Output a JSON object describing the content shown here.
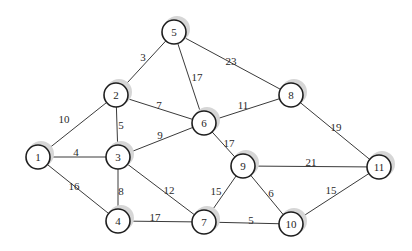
{
  "diagram": {
    "type": "weighted-undirected-graph",
    "node_radius": 12,
    "nodes": [
      {
        "id": "1",
        "x": 38,
        "y": 157
      },
      {
        "id": "2",
        "x": 116,
        "y": 95
      },
      {
        "id": "3",
        "x": 118,
        "y": 157
      },
      {
        "id": "4",
        "x": 118,
        "y": 221
      },
      {
        "id": "5",
        "x": 174,
        "y": 32
      },
      {
        "id": "6",
        "x": 204,
        "y": 123
      },
      {
        "id": "7",
        "x": 204,
        "y": 222
      },
      {
        "id": "8",
        "x": 291,
        "y": 95
      },
      {
        "id": "9",
        "x": 243,
        "y": 166
      },
      {
        "id": "10",
        "x": 291,
        "y": 224
      },
      {
        "id": "11",
        "x": 379,
        "y": 167
      }
    ],
    "edges": [
      {
        "from": "1",
        "to": "2",
        "weight": "10",
        "lx": 64,
        "ly": 120
      },
      {
        "from": "1",
        "to": "3",
        "weight": "4",
        "lx": 76,
        "ly": 153
      },
      {
        "from": "1",
        "to": "4",
        "weight": "16",
        "lx": 74,
        "ly": 187
      },
      {
        "from": "2",
        "to": "5",
        "weight": "3",
        "lx": 143,
        "ly": 58
      },
      {
        "from": "2",
        "to": "3",
        "weight": "5",
        "lx": 121,
        "ly": 126
      },
      {
        "from": "2",
        "to": "6",
        "weight": "7",
        "lx": 159,
        "ly": 106
      },
      {
        "from": "3",
        "to": "6",
        "weight": "9",
        "lx": 160,
        "ly": 136
      },
      {
        "from": "3",
        "to": "4",
        "weight": "8",
        "lx": 121,
        "ly": 192
      },
      {
        "from": "3",
        "to": "7",
        "weight": "12",
        "lx": 169,
        "ly": 191
      },
      {
        "from": "4",
        "to": "7",
        "weight": "17",
        "lx": 155,
        "ly": 218
      },
      {
        "from": "5",
        "to": "6",
        "weight": "17",
        "lx": 197,
        "ly": 78
      },
      {
        "from": "5",
        "to": "8",
        "weight": "23",
        "lx": 231,
        "ly": 62
      },
      {
        "from": "6",
        "to": "8",
        "weight": "11",
        "lx": 243,
        "ly": 106
      },
      {
        "from": "6",
        "to": "9",
        "weight": "17",
        "lx": 229,
        "ly": 144
      },
      {
        "from": "7",
        "to": "9",
        "weight": "15",
        "lx": 216,
        "ly": 192
      },
      {
        "from": "7",
        "to": "10",
        "weight": "5",
        "lx": 251,
        "ly": 221
      },
      {
        "from": "9",
        "to": "10",
        "weight": "6",
        "lx": 271,
        "ly": 194
      },
      {
        "from": "9",
        "to": "11",
        "weight": "21",
        "lx": 311,
        "ly": 163
      },
      {
        "from": "8",
        "to": "11",
        "weight": "19",
        "lx": 336,
        "ly": 128
      },
      {
        "from": "10",
        "to": "11",
        "weight": "15",
        "lx": 331,
        "ly": 191
      }
    ]
  }
}
